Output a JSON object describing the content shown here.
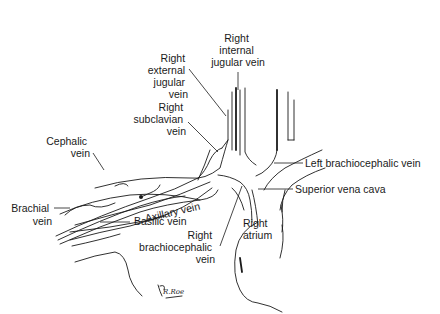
{
  "diagram": {
    "labels": {
      "right_internal_jugular_vein": [
        "Right",
        "internal",
        "jugular vein"
      ],
      "right_external_jugular_vein": [
        "Right",
        "external",
        "jugular",
        "vein"
      ],
      "right_subclavian_vein": [
        "Right",
        "subclavian",
        "vein"
      ],
      "cephalic_vein": [
        "Cephalic",
        "vein"
      ],
      "axillary_vein": "Axillary vein",
      "brachial_vein": [
        "Brachial",
        "vein"
      ],
      "basilic_vein": "Basilic vein",
      "right_brachiocephalic_vein": [
        "Right",
        "brachiocephalic",
        "vein"
      ],
      "left_brachiocephalic_vein": "Left brachiocephalic vein",
      "superior_vena_cava": "Superior vena cava",
      "right_atrium": [
        "Right",
        "atrium"
      ]
    },
    "signature": "R.Roe"
  }
}
